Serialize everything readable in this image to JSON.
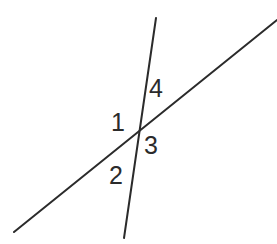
{
  "figure": {
    "width": 277,
    "height": 244,
    "background_color": "#ffffff",
    "stroke_color": "#2b2b2b",
    "stroke_width": 2,
    "label_color": "#2b2b2b",
    "label_font_size": 25
  },
  "lines": [
    {
      "name": "rising-transversal-line",
      "description": "Line rising from lower-left to upper-right",
      "x1": 14,
      "y1": 232,
      "x2": 277,
      "y2": 20
    },
    {
      "name": "steep-descending-line",
      "description": "Steep line from upper-right to lower-left, nearly vertical",
      "x1": 156,
      "y1": 18,
      "x2": 124,
      "y2": 238
    }
  ],
  "intersection": {
    "name": "intersection-point",
    "x": 135,
    "y": 136
  },
  "angle_labels": [
    {
      "id": "1",
      "text": "1",
      "x": 119,
      "y": 123,
      "position": "left-of-intersection"
    },
    {
      "id": "2",
      "text": "2",
      "x": 117,
      "y": 176,
      "position": "below-left-of-intersection"
    },
    {
      "id": "3",
      "text": "3",
      "x": 151,
      "y": 146,
      "position": "right-of-intersection"
    },
    {
      "id": "4",
      "text": "4",
      "x": 156,
      "y": 89,
      "position": "above-right-of-intersection"
    }
  ]
}
